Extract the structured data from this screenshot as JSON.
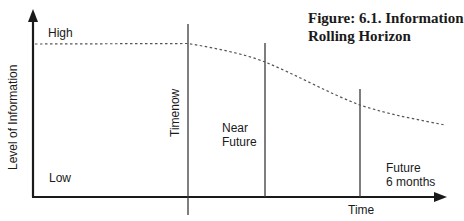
{
  "figure": {
    "title_line1": "Figure: 6.1.  Information",
    "title_line2": "Rolling Horizon"
  },
  "axes": {
    "y_label": "Level of Information",
    "x_label": "Time",
    "y_high": "High",
    "y_low": "Low"
  },
  "markers": [
    {
      "id": "timenow",
      "label": "Timenow"
    },
    {
      "id": "near-future",
      "label_line1": "Near",
      "label_line2": "Future"
    },
    {
      "id": "future-6-months",
      "label_line1": "Future",
      "label_line2": "6 months"
    }
  ],
  "colors": {
    "axis": "#1a1a1a",
    "marker_line": "#3a3a3a",
    "curve": "#555555"
  }
}
